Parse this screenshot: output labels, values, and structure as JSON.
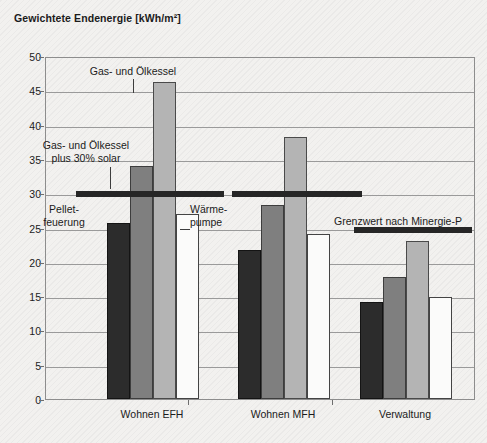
{
  "chart_data": {
    "type": "bar",
    "title": "Gewichtete Endenergie [kWh/m²]",
    "xlabel": "",
    "ylabel": "",
    "ylim": [
      0,
      50
    ],
    "yticks": [
      0,
      5,
      10,
      15,
      20,
      25,
      30,
      35,
      40,
      45,
      50
    ],
    "grid": true,
    "legend": "none",
    "categories": [
      "Wohnen EFH",
      "Wohnen MFH",
      "Verwaltung"
    ],
    "series": [
      {
        "name": "Pelletfeuerung",
        "color": "#2c2c2c",
        "values": [
          25.7,
          21.7,
          14.2
        ]
      },
      {
        "name": "Gas- und Ölkessel plus 30% solar",
        "color": "#7f7f7f",
        "values": [
          34.0,
          28.3,
          17.8
        ]
      },
      {
        "name": "Gas- und Ölkessel",
        "color": "#b4b4b4",
        "values": [
          46.2,
          38.2,
          23.0
        ]
      },
      {
        "name": "Wärmepumpe",
        "color": "#fbfbfa",
        "values": [
          27.0,
          24.1,
          14.9
        ]
      }
    ],
    "threshold_lines": [
      {
        "label": "",
        "value": 30.2,
        "group": "Wohnen EFH"
      },
      {
        "label": "",
        "value": 30.2,
        "group": "Wohnen MFH"
      },
      {
        "label": "Grenzwert nach Minergie-P",
        "value": 25.0,
        "group": "Verwaltung"
      }
    ],
    "annotations": [
      {
        "name": "gas-oil-boiler",
        "text": "Gas- und Ölkessel"
      },
      {
        "name": "gas-oil-boiler-solar",
        "text_line1": "Gas- und Ölkessel",
        "text_line2": "plus 30% solar"
      },
      {
        "name": "pellet-heating",
        "text_line1": "Pellet-",
        "text_line2": "feuerung"
      },
      {
        "name": "heat-pump",
        "text_line1": "Wärme-",
        "text_line2": "pumpe"
      },
      {
        "name": "minergie-p-limit",
        "text": "Grenzwert nach Minergie-P"
      }
    ]
  },
  "ytick_labels": {
    "t0": "0",
    "t1": "5",
    "t2": "10",
    "t3": "15",
    "t4": "20",
    "t5": "25",
    "t6": "30",
    "t7": "35",
    "t8": "40",
    "t9": "45",
    "t10": "50"
  },
  "category_labels": {
    "c0": "Wohnen EFH",
    "c1": "Wohnen MFH",
    "c2": "Verwaltung"
  },
  "annotation_text": {
    "gas_oil_boiler": "Gas- und Ölkessel",
    "gas_oil_solar_l1": "Gas- und Ölkessel",
    "gas_oil_solar_l2": "plus 30% solar",
    "pellet_l1": "Pellet-",
    "pellet_l2": "feuerung",
    "heatpump_l1": "Wärme-",
    "heatpump_l2": "pumpe",
    "minergie": "Grenzwert nach Minergie-P"
  },
  "caption": ""
}
